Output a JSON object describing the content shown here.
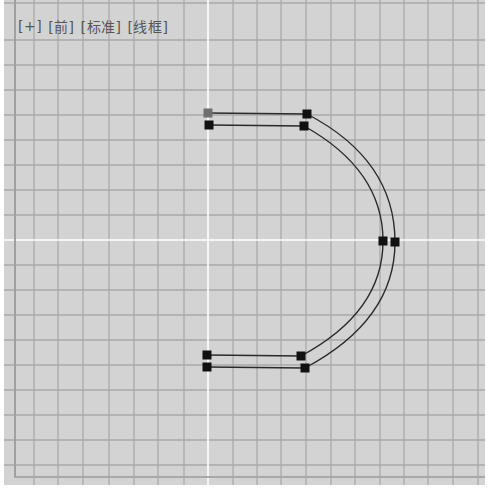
{
  "viewport": {
    "labels": {
      "plus": "[+]",
      "view": "[前]",
      "shading_standard": "[标准]",
      "shading_mode": "[线框]"
    },
    "colors": {
      "background": "#d3d3d3",
      "grid_line": "#a9a9a9",
      "axis_line": "#ffffff",
      "spline": "#2a2a2a",
      "vertex": "#111111",
      "vertex_first": "#6e6e6e"
    },
    "grid": {
      "vertical_lines_x": [
        34,
        58,
        83,
        109,
        134,
        158,
        184,
        233,
        257,
        281,
        306,
        331,
        355,
        380,
        404,
        428,
        453,
        478
      ],
      "horizontal_lines_y": [
        3,
        40,
        65,
        90,
        115,
        140,
        165,
        190,
        215,
        265,
        290,
        315,
        340,
        365,
        390,
        415,
        440,
        465
      ],
      "axis_x": 208,
      "axis_y": 240
    },
    "spline": {
      "outer_path": "M208 113 L307 114 Q395 160 395 242 Q395 320 305 368 L207 367",
      "inner_path": "M209 125 L304 126 Q383 170 383 241 Q383 312 301 356 L207 355",
      "vertices": [
        {
          "x": 208,
          "y": 113,
          "first": true
        },
        {
          "x": 209,
          "y": 125,
          "first": false
        },
        {
          "x": 307,
          "y": 114,
          "first": false
        },
        {
          "x": 304,
          "y": 126,
          "first": false
        },
        {
          "x": 383,
          "y": 241,
          "first": false
        },
        {
          "x": 395,
          "y": 242,
          "first": false
        },
        {
          "x": 207,
          "y": 355,
          "first": false
        },
        {
          "x": 207,
          "y": 367,
          "first": false
        },
        {
          "x": 301,
          "y": 356,
          "first": false
        },
        {
          "x": 305,
          "y": 368,
          "first": false
        }
      ]
    }
  }
}
